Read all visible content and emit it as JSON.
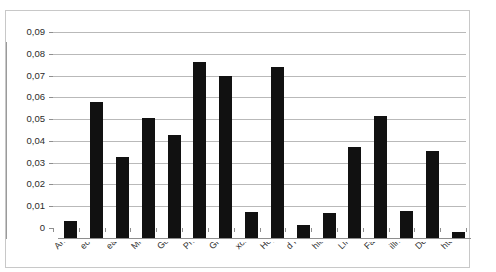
{
  "chart_data": {
    "type": "bar",
    "title": "",
    "subtitle": "",
    "xlabel": "",
    "ylabel": "",
    "ylim": [
      0,
      0.09
    ],
    "grid": true,
    "legend": false,
    "decimal_separator": ",",
    "axis": {
      "y_ticks": [
        "0,09",
        "0,08",
        "0,07",
        "0,06",
        "0,05",
        "0,04",
        "0,03",
        "0,02",
        "0,01",
        "0"
      ],
      "y_tick_values": [
        0.09,
        0.08,
        0.07,
        0.06,
        0.05,
        0.04,
        0.03,
        0.02,
        0.01,
        0
      ]
    },
    "categories": [
      "Anger",
      "ection",
      "ealistic",
      "Miracle",
      "God",
      "Prayer",
      "Grief",
      "xciting",
      "Hope",
      "d Faith",
      "hioned",
      "Life",
      "Faith",
      "illness",
      "Death",
      "htening"
    ],
    "values": [
      0.0078,
      0.0625,
      0.0374,
      0.0552,
      0.0472,
      0.0808,
      0.0744,
      0.0118,
      0.0787,
      0.006,
      0.0114,
      0.0418,
      0.0561,
      0.0125,
      0.0398,
      0.0029
    ],
    "colors": {
      "bar": "#111111",
      "gridline": "#b9b9b9",
      "axis": "#8e8e8e",
      "frame": "#c8c8c8",
      "background": "#ffffff",
      "text": "#2b2b2b"
    }
  }
}
